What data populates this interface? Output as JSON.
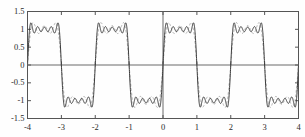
{
  "chart_data": {
    "type": "line",
    "title": "",
    "subtitle": "",
    "xlabel": "",
    "ylabel": "",
    "xlim": [
      -4,
      4
    ],
    "ylim": [
      -1.5,
      1.5
    ],
    "grid": false,
    "legend_position": "none",
    "x_ticks": [
      -4,
      -3,
      -2,
      -1,
      0,
      1,
      2,
      3,
      4
    ],
    "x_tick_labels": [
      "-4",
      "-3",
      "-2",
      "-1",
      "0",
      "1",
      "2",
      "3",
      "4"
    ],
    "y_ticks": [
      1.5,
      1,
      0.5,
      0,
      -0.5,
      -1,
      -1.5
    ],
    "y_tick_labels": [
      "1.5",
      "1",
      "0.5",
      "0",
      "-0.5",
      "-1",
      "-1.5"
    ],
    "axis_lines": {
      "x_zero": 0,
      "y_zero": 0
    },
    "square_wave": {
      "period": 2,
      "amplitude": 1,
      "jumps": [
        -4,
        -3,
        -2,
        -1,
        0,
        1,
        2,
        3,
        4
      ]
    },
    "series": [
      {
        "name": "partial-sum-high",
        "harmonics": 9,
        "style": "solid",
        "color": "#3b3b3b",
        "width": 1.0,
        "overshoot": 1.18,
        "ripples_per_plateau": 5
      },
      {
        "name": "partial-sum-low",
        "harmonics": 5,
        "style": "dashed",
        "color": "#a8a8a8",
        "width": 0.9,
        "overshoot": 1.17,
        "ripples_per_plateau": 3
      }
    ]
  },
  "figure": {
    "border_color": "#555555",
    "axis_color": "#6a6a6a",
    "background": "#fefefe"
  }
}
